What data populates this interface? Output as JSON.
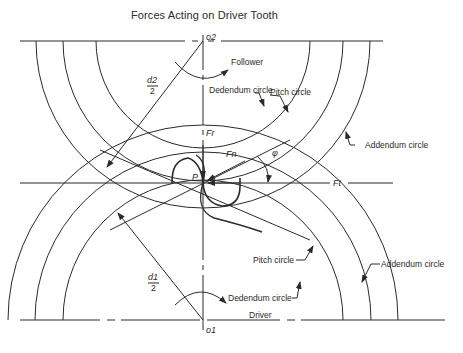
{
  "title": "Forces Acting on Driver Tooth",
  "centers": {
    "top": "o2",
    "bottom": "o1",
    "pitch_point": "P"
  },
  "follower_gear": {
    "name": "Follower",
    "radius_label_num": "d2",
    "radius_label_den": "2",
    "labels": {
      "pitch": "Pitch circle",
      "dedendum": "Dedendum circle",
      "addendum": "Addendum circle"
    }
  },
  "driver_gear": {
    "name": "Driver",
    "radius_label_num": "d1",
    "radius_label_den": "2",
    "labels": {
      "pitch": "Pitch circle",
      "dedendum": "Dedendum circle",
      "addendum": "Addendum circle"
    }
  },
  "forces": {
    "radial": "Fr",
    "normal": "Fn",
    "tangential": "Ft",
    "pressure_angle": "φ"
  },
  "colors": {
    "line": "#2a2a2a",
    "background": "#ffffff"
  }
}
